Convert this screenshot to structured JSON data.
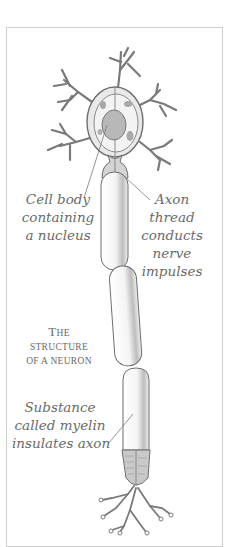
{
  "diagram": {
    "title": {
      "line1_first": "T",
      "line1_rest": "HE",
      "line2": "STRUCTURE",
      "line3": "OF A NEURON"
    },
    "labels": {
      "cell_body": [
        "Cell body",
        "containing",
        "a nucleus"
      ],
      "axon": [
        "Axon",
        "thread",
        "conducts",
        "nerve",
        "impulses"
      ],
      "myelin": [
        "Substance",
        "called myelin",
        "insulates axon"
      ]
    },
    "colors": {
      "line": "#6e6e6e",
      "shade": "#9a9a9a",
      "text": "#6a6a6a",
      "frame": "#cfcfcf"
    }
  }
}
